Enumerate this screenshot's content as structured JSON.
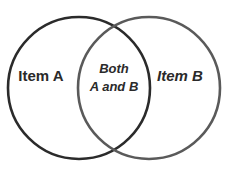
{
  "diagram": {
    "type": "venn",
    "sets": [
      {
        "label": "Item A",
        "stroke": "#2b2b2b"
      },
      {
        "label": "Item B",
        "stroke": "#5a5a5a"
      }
    ],
    "intersection": {
      "line1": "Both",
      "line2": "A and B"
    }
  }
}
